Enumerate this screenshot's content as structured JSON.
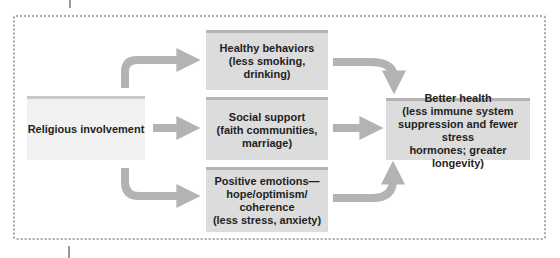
{
  "diagram": {
    "type": "flow",
    "source": {
      "label": "Religious involvement"
    },
    "mediators": [
      {
        "label": "Healthy behaviors\n(less smoking, drinking)"
      },
      {
        "label": "Social support\n(faith communities,\nmarriage)"
      },
      {
        "label": "Positive emotions—\nhope/optimism/\ncoherence\n(less stress, anxiety)"
      }
    ],
    "outcome": {
      "label": "Better health\n(less immune system\nsuppression and fewer stress\nhormones; greater longevity)"
    },
    "edges": [
      {
        "from": "Religious involvement",
        "to": "Healthy behaviors"
      },
      {
        "from": "Religious involvement",
        "to": "Social support"
      },
      {
        "from": "Religious involvement",
        "to": "Positive emotions"
      },
      {
        "from": "Healthy behaviors",
        "to": "Better health"
      },
      {
        "from": "Social support",
        "to": "Better health"
      },
      {
        "from": "Positive emotions",
        "to": "Better health"
      }
    ],
    "colors": {
      "arrow": "#b3b3b3",
      "source_fill": "#f1f1f1",
      "box_fill": "#dcdcdc",
      "frame_dots": "#a8a8a8"
    }
  }
}
